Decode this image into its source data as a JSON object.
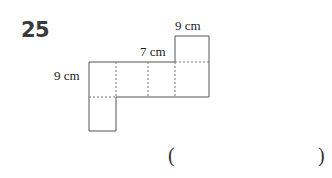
{
  "problem": {
    "number": "25",
    "labels": {
      "top_tab_width": "9 cm",
      "middle_height": "7 cm",
      "left_height": "9 cm"
    },
    "answer": {
      "open_paren": "(",
      "close_paren": ")",
      "value": ""
    }
  },
  "colors": {
    "number": "#3a3a3a",
    "solid_line": "#555555",
    "dashed_line": "#777777"
  }
}
